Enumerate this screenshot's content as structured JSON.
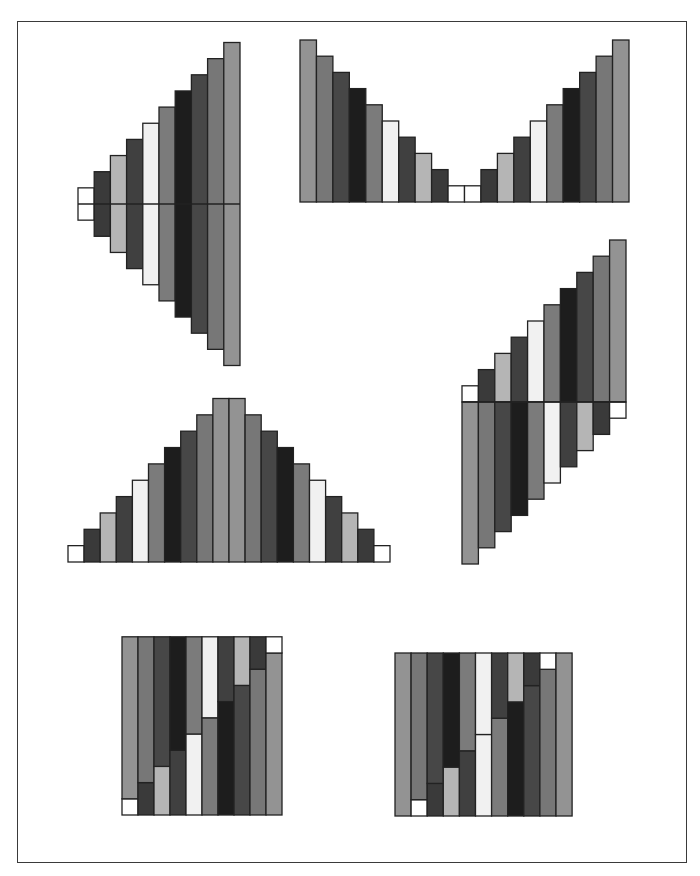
{
  "figure": {
    "title": ""
  },
  "palette": {
    "rank_1": "#ffffff",
    "rank_2": "#3a3a3a",
    "rank_3": "#b5b5b5",
    "rank_4": "#404040",
    "rank_5": "#f1f1f1",
    "rank_6": "#7b7b7b",
    "rank_7": "#1d1d1d",
    "rank_8": "#474747",
    "rank_9": "#777777",
    "rank_10": "#939393",
    "outline": "#222222"
  },
  "chart_data": [
    {
      "id": "panel-diamond",
      "type": "bar",
      "layout": "centered-symmetric",
      "description": "Ranks 1..10 left to right, each bar centered on a horizontal axis line",
      "ranks": [
        1,
        2,
        3,
        4,
        5,
        6,
        7,
        8,
        9,
        10
      ],
      "x": 78,
      "bar_width": 16.2,
      "center_y": 204,
      "unit": 32.3,
      "axis_line": true
    },
    {
      "id": "panel-valley",
      "type": "bar",
      "layout": "baseline",
      "description": "Descending ranks 10..1 then ascending 1..10 on a common baseline (V shape)",
      "ranks": [
        10,
        9,
        8,
        7,
        6,
        5,
        4,
        3,
        2,
        1,
        1,
        2,
        3,
        4,
        5,
        6,
        7,
        8,
        9,
        10
      ],
      "x": 300,
      "bar_width": 16.45,
      "baseline_y": 202,
      "unit": 16.2
    },
    {
      "id": "panel-pyramid",
      "type": "bar",
      "layout": "baseline",
      "description": "Ascending ranks 1..10 then descending 10..1 on a common baseline (triangle)",
      "ranks": [
        1,
        2,
        3,
        4,
        5,
        6,
        7,
        8,
        9,
        10,
        10,
        9,
        8,
        7,
        6,
        5,
        4,
        3,
        2,
        1
      ],
      "x": 68,
      "bar_width": 16.1,
      "baseline_y": 562,
      "unit": 16.35
    },
    {
      "id": "panel-staircase",
      "type": "bar",
      "layout": "split-axis",
      "description": "Upper bars ranks 1..10 rising above an axis; lower bars ranks 10..1 hanging below",
      "upper_ranks": [
        1,
        2,
        3,
        4,
        5,
        6,
        7,
        8,
        9,
        10
      ],
      "lower_ranks": [
        10,
        9,
        8,
        7,
        6,
        5,
        4,
        3,
        2,
        1
      ],
      "x": 462,
      "bar_width": 16.4,
      "axis_y": 402,
      "unit": 16.2,
      "axis_line": true
    },
    {
      "id": "panel-stacked-10",
      "type": "bar",
      "layout": "stacked-rectangle",
      "description": "Ten columns each stacking rank i (bottom) with rank 11-i (top) to fill a rectangle",
      "bottom_ranks": [
        1,
        2,
        3,
        4,
        5,
        6,
        7,
        8,
        9,
        10
      ],
      "top_ranks": [
        10,
        9,
        8,
        7,
        6,
        5,
        4,
        3,
        2,
        1
      ],
      "x": 122,
      "bar_width": 16.0,
      "bottom_y": 815,
      "unit": 16.2
    },
    {
      "id": "panel-stacked-11",
      "type": "bar",
      "layout": "stacked-rectangle",
      "description": "Eleven columns: full rank-10 bars at each end, inner columns stack rank i (bottom) with rank 10-i (top)",
      "bottom_ranks": [
        10,
        1,
        2,
        3,
        4,
        5,
        6,
        7,
        8,
        9,
        0
      ],
      "top_ranks": [
        0,
        9,
        8,
        7,
        6,
        5,
        4,
        3,
        2,
        1,
        10
      ],
      "x": 395,
      "bar_width": 16.1,
      "bottom_y": 816,
      "unit": 16.3
    }
  ]
}
